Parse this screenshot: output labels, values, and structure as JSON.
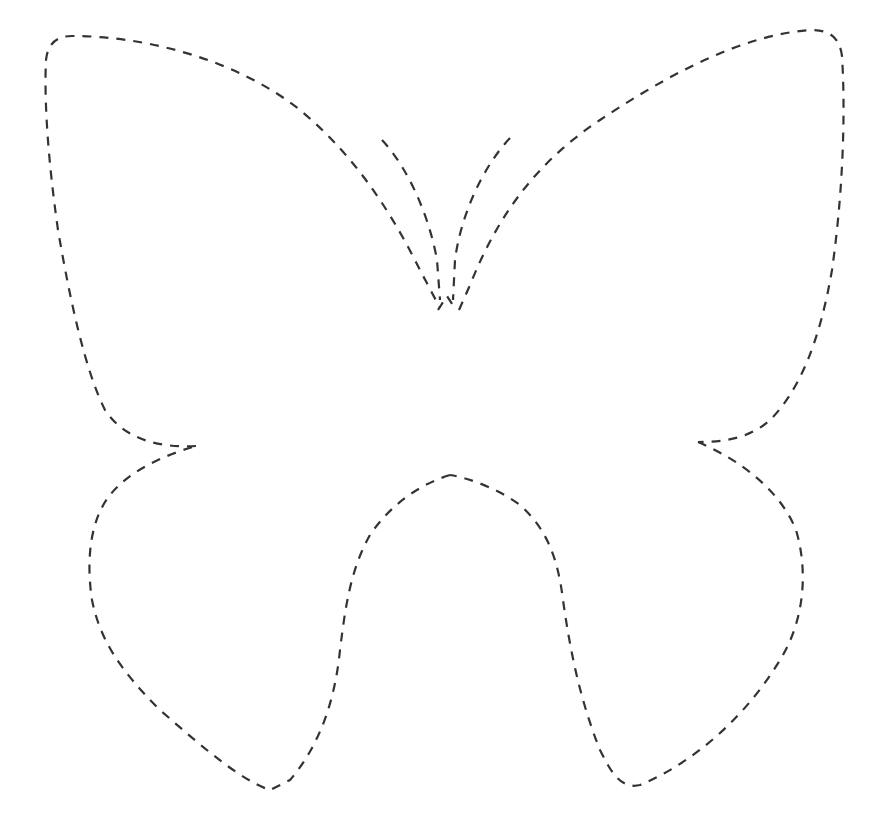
{
  "canvas": {
    "width": 870,
    "height": 816,
    "background": "#ffffff"
  },
  "figure": {
    "style": "dashed-cut-line",
    "stroke_color": "#333333",
    "parts": [
      {
        "name": "upper-left-wing"
      },
      {
        "name": "upper-right-wing"
      },
      {
        "name": "lower-left-wing"
      },
      {
        "name": "lower-right-wing"
      },
      {
        "name": "left-antenna"
      },
      {
        "name": "right-antenna"
      }
    ]
  }
}
